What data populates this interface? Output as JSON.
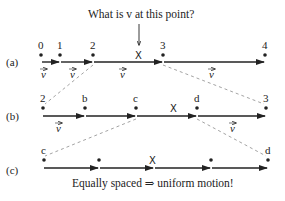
{
  "title": "What is v at this point?",
  "caption": "Equally spaced ⇒ uniform motion!",
  "marker_label": "X",
  "vector_label": "v",
  "rows": [
    {
      "label": "(a)",
      "points": [
        {
          "name": "0"
        },
        {
          "name": "1"
        },
        {
          "name": "2"
        },
        {
          "name": "3"
        },
        {
          "name": "4"
        }
      ]
    },
    {
      "label": "(b)",
      "points": [
        {
          "name": "2"
        },
        {
          "name": "b"
        },
        {
          "name": "c"
        },
        {
          "name": "d"
        },
        {
          "name": "3"
        }
      ]
    },
    {
      "label": "(c)",
      "points": [
        {
          "name": "c"
        },
        {
          "name": ""
        },
        {
          "name": ""
        },
        {
          "name": ""
        },
        {
          "name": "d"
        }
      ]
    }
  ],
  "colors": {
    "ink": "#222222",
    "dashed": "#999999"
  }
}
